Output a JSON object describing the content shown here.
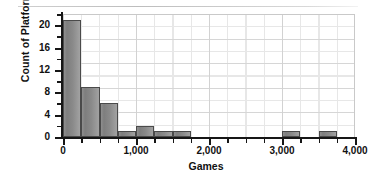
{
  "figure": {
    "title": "",
    "x_axis_title": "Games",
    "y_axis_title": "Count of Platforms"
  },
  "axes": {
    "y_ticks": [
      "0",
      "4",
      "8",
      "12",
      "16",
      "20"
    ],
    "x_ticks": [
      "0",
      "1,000",
      "2,000",
      "3,000",
      "4,000"
    ]
  },
  "chart_data": {
    "type": "bar",
    "title": "",
    "xlabel": "Games",
    "ylabel": "Count of Platforms",
    "xlim": [
      0,
      4000
    ],
    "ylim": [
      0,
      22
    ],
    "grid": true,
    "legend": null,
    "bin_width": 250,
    "categories": [
      "0-250",
      "250-500",
      "500-750",
      "750-1,000",
      "1,000-1,250",
      "1,250-1,500",
      "1,500-1,750",
      "1,750-2,000",
      "2,000-2,250",
      "2,250-2,500",
      "2,500-2,750",
      "2,750-3,000",
      "3,000-3,250",
      "3,250-3,500",
      "3,500-3,750",
      "3,750-4,000"
    ],
    "bin_starts": [
      0,
      250,
      500,
      750,
      1000,
      1250,
      1500,
      1750,
      2000,
      2250,
      2500,
      2750,
      3000,
      3250,
      3500,
      3750
    ],
    "values": [
      21,
      9,
      6,
      1,
      2,
      1,
      1,
      0,
      0,
      0,
      0,
      0,
      1,
      0,
      1,
      0
    ],
    "y_tick_values": [
      0,
      4,
      8,
      12,
      16,
      20
    ],
    "x_tick_values": [
      0,
      1000,
      2000,
      3000,
      4000
    ]
  },
  "style": {
    "bar_fill": "#8a8a8a",
    "bar_edge": "#4a4a4a",
    "grid_color": "#e3e3e3",
    "axis_color": "#161616",
    "background": "#ffffff"
  }
}
